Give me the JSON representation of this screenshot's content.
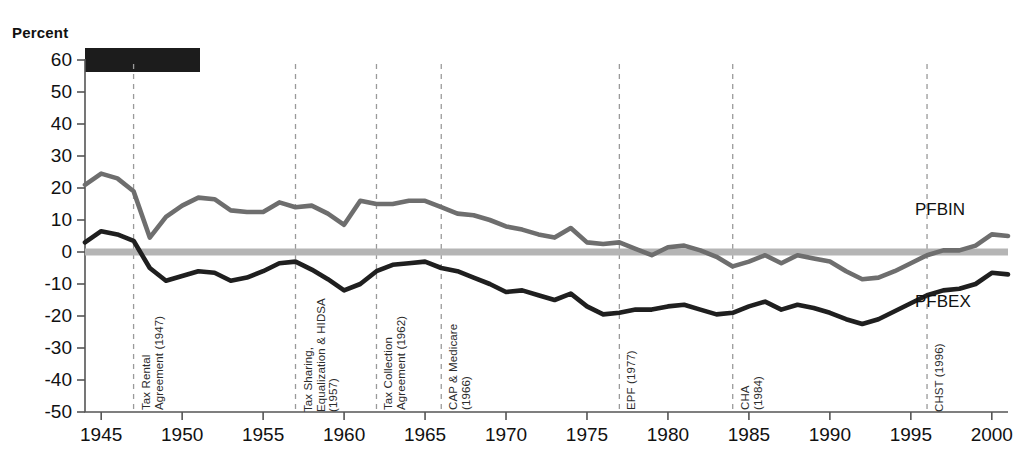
{
  "figure": {
    "percent_label": "Percent",
    "redaction_note": "redacted-title-bar"
  },
  "series_labels": {
    "pfbin": "PFBIN",
    "pfbex": "PFBEX"
  },
  "chart_data": {
    "type": "line",
    "title": "",
    "xlabel": "",
    "ylabel": "Percent",
    "xlim": [
      1944,
      2001
    ],
    "ylim": [
      -50,
      60
    ],
    "ytick_labels": [
      "60",
      "50",
      "40",
      "30",
      "20",
      "10",
      "0",
      "-10",
      "-20",
      "-30",
      "-40",
      "-50"
    ],
    "ytick_values": [
      60,
      50,
      40,
      30,
      20,
      10,
      0,
      -10,
      -20,
      -30,
      -40,
      -50
    ],
    "xtick_labels": [
      "1945",
      "1950",
      "1955",
      "1960",
      "1965",
      "1970",
      "1975",
      "1980",
      "1985",
      "1990",
      "1995",
      "2000"
    ],
    "xtick_values": [
      1945,
      1950,
      1955,
      1960,
      1965,
      1970,
      1975,
      1980,
      1985,
      1990,
      1995,
      2000
    ],
    "grid": false,
    "legend_position": "inline-right",
    "zero_line": 0,
    "x": [
      1944,
      1945,
      1946,
      1947,
      1948,
      1949,
      1950,
      1951,
      1952,
      1953,
      1954,
      1955,
      1956,
      1957,
      1958,
      1959,
      1960,
      1961,
      1962,
      1963,
      1964,
      1965,
      1966,
      1967,
      1968,
      1969,
      1970,
      1971,
      1972,
      1973,
      1974,
      1975,
      1976,
      1977,
      1978,
      1979,
      1980,
      1981,
      1982,
      1983,
      1984,
      1985,
      1986,
      1987,
      1988,
      1989,
      1990,
      1991,
      1992,
      1993,
      1994,
      1995,
      1996,
      1997,
      1998,
      1999,
      2000,
      2001
    ],
    "series": [
      {
        "name": "PFBIN",
        "color": "#6e6e6e",
        "values": [
          21.0,
          24.5,
          23.0,
          19.0,
          4.5,
          11.0,
          14.5,
          17.0,
          16.5,
          13.0,
          12.5,
          12.5,
          15.5,
          14.0,
          14.5,
          12.0,
          8.5,
          16.0,
          15.0,
          15.0,
          16.0,
          16.0,
          14.0,
          12.0,
          11.5,
          10.0,
          8.0,
          7.0,
          5.5,
          4.5,
          7.5,
          3.0,
          2.5,
          3.0,
          1.0,
          -1.0,
          1.5,
          2.0,
          0.5,
          -1.5,
          -4.5,
          -3.0,
          -1.0,
          -3.5,
          -1.0,
          -2.0,
          -3.0,
          -6.0,
          -8.5,
          -8.0,
          -6.0,
          -3.5,
          -1.0,
          0.5,
          0.5,
          2.0,
          5.5,
          5.0
        ]
      },
      {
        "name": "PFBEX",
        "color": "#1f1f1f",
        "values": [
          3.0,
          6.5,
          5.5,
          3.5,
          -5.0,
          -9.0,
          -7.5,
          -6.0,
          -6.5,
          -9.0,
          -8.0,
          -6.0,
          -3.5,
          -3.0,
          -5.5,
          -8.5,
          -12.0,
          -10.0,
          -6.0,
          -4.0,
          -3.5,
          -3.0,
          -5.0,
          -6.0,
          -8.0,
          -10.0,
          -12.5,
          -12.0,
          -13.5,
          -15.0,
          -13.0,
          -17.0,
          -19.5,
          -19.0,
          -18.0,
          -18.0,
          -17.0,
          -16.5,
          -18.0,
          -19.5,
          -19.0,
          -17.0,
          -15.5,
          -18.0,
          -16.5,
          -17.5,
          -19.0,
          -21.0,
          -22.5,
          -21.0,
          -18.5,
          -16.0,
          -13.5,
          -12.0,
          -11.5,
          -10.0,
          -6.5,
          -7.0
        ]
      }
    ],
    "events": [
      {
        "label": "Tax Rental\nAgreement (1947)",
        "year": 1947
      },
      {
        "label": "Tax Sharing,\nEqualization & HIDSA\n(1957)",
        "year": 1957
      },
      {
        "label": "Tax Collection\nAgreement (1962)",
        "year": 1962
      },
      {
        "label": "CAP & Medicare\n(1966)",
        "year": 1966
      },
      {
        "label": "EPF (1977)",
        "year": 1977
      },
      {
        "label": "CHA\n(1984)",
        "year": 1984
      },
      {
        "label": "CHST (1996)",
        "year": 1996
      }
    ],
    "colors": {
      "pfbin": "#6e6e6e",
      "pfbex": "#1f1f1f",
      "zero_line": "#b5b5b5",
      "axis": "#555555",
      "event_line": "#9a9a9a"
    }
  }
}
